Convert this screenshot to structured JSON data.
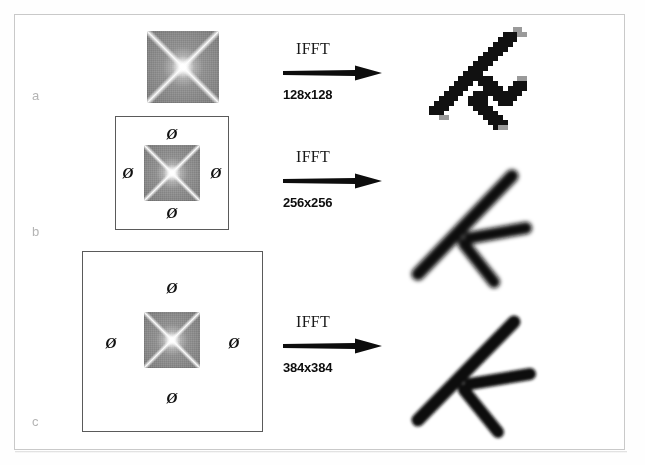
{
  "figure": {
    "caption_ghost": "",
    "background_color": "#ffffff",
    "frame_color": "#c9c9c9",
    "pad_box_color": "#5a5a5a",
    "row_label_color": "#b4b4b4",
    "ink_color": "#111111"
  },
  "rows": [
    {
      "key": "a",
      "label": "a",
      "spectrum": {
        "name": "fft-magnitude-128",
        "size": "128x128",
        "padded": false
      },
      "transform": {
        "operation": "IFFT",
        "output_size": "128x128"
      },
      "result": {
        "name": "reconstructed-letter-f-128",
        "description": "blocky pixelated rotated F"
      },
      "zero_markers": []
    },
    {
      "key": "b",
      "label": "b",
      "spectrum": {
        "name": "fft-magnitude-256",
        "size": "128x128",
        "padded": true
      },
      "transform": {
        "operation": "IFFT",
        "output_size": "256x256"
      },
      "result": {
        "name": "reconstructed-letter-f-256",
        "description": "smoother rotated F"
      },
      "zero_markers": [
        "Ø",
        "Ø",
        "Ø",
        "Ø"
      ]
    },
    {
      "key": "c",
      "label": "c",
      "spectrum": {
        "name": "fft-magnitude-384",
        "size": "128x128",
        "padded": true
      },
      "transform": {
        "operation": "IFFT",
        "output_size": "384x384"
      },
      "result": {
        "name": "reconstructed-letter-f-384",
        "description": "smoothest rotated F"
      },
      "zero_markers": [
        "Ø",
        "Ø",
        "Ø",
        "Ø"
      ]
    }
  ],
  "legend": {
    "zero_symbol": "Ø",
    "zero_meaning": "zero-padded region"
  }
}
